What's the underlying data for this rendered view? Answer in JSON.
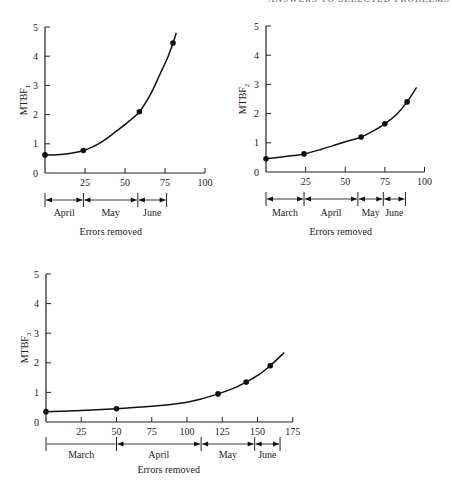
{
  "header": {
    "text": "ANSWERS TO SELECTED PROBLEMS"
  },
  "chart_data": [
    {
      "type": "line",
      "title": "",
      "xlabel": "Errors removed",
      "ylabel": "MTBF1",
      "ylabel_main": "MTBF",
      "ylabel_sub": "1",
      "xlim": [
        0,
        100
      ],
      "ylim": [
        0,
        5
      ],
      "x_ticks": [
        25,
        50,
        75,
        100
      ],
      "y_ticks": [
        0,
        1,
        2,
        3,
        4,
        5
      ],
      "grid": false,
      "points": [
        {
          "x": 0,
          "y": 0.62
        },
        {
          "x": 24,
          "y": 0.77
        },
        {
          "x": 59,
          "y": 2.1
        },
        {
          "x": 80,
          "y": 4.45
        }
      ],
      "curve": [
        [
          0,
          0.62
        ],
        [
          10,
          0.63
        ],
        [
          24,
          0.77
        ],
        [
          35,
          1.05
        ],
        [
          45,
          1.45
        ],
        [
          52,
          1.75
        ],
        [
          59,
          2.1
        ],
        [
          66,
          2.7
        ],
        [
          72,
          3.4
        ],
        [
          77,
          4.0
        ],
        [
          80,
          4.45
        ],
        [
          82,
          4.8
        ]
      ],
      "months": [
        {
          "label": "April",
          "from": 0,
          "to": 24
        },
        {
          "label": "May",
          "from": 24,
          "to": 58
        },
        {
          "label": "June",
          "from": 58,
          "to": 76
        }
      ]
    },
    {
      "type": "line",
      "title": "",
      "xlabel": "Errors removed",
      "ylabel": "MTBF2",
      "ylabel_main": "MTBF",
      "ylabel_sub": "2",
      "xlim": [
        0,
        100
      ],
      "ylim": [
        0,
        5
      ],
      "x_ticks": [
        25,
        50,
        75,
        100
      ],
      "y_ticks": [
        0,
        1,
        2,
        3,
        4,
        5
      ],
      "grid": false,
      "points": [
        {
          "x": 0,
          "y": 0.45
        },
        {
          "x": 24,
          "y": 0.62
        },
        {
          "x": 60,
          "y": 1.2
        },
        {
          "x": 75,
          "y": 1.65
        },
        {
          "x": 89,
          "y": 2.4
        }
      ],
      "curve": [
        [
          0,
          0.45
        ],
        [
          12,
          0.53
        ],
        [
          24,
          0.62
        ],
        [
          35,
          0.78
        ],
        [
          45,
          0.95
        ],
        [
          53,
          1.08
        ],
        [
          60,
          1.2
        ],
        [
          68,
          1.42
        ],
        [
          75,
          1.65
        ],
        [
          82,
          1.95
        ],
        [
          89,
          2.4
        ],
        [
          95,
          2.9
        ]
      ],
      "months": [
        {
          "label": "March",
          "from": 0,
          "to": 24
        },
        {
          "label": "April",
          "from": 24,
          "to": 58
        },
        {
          "label": "May",
          "from": 58,
          "to": 74
        },
        {
          "label": "June",
          "from": 74,
          "to": 88
        }
      ]
    },
    {
      "type": "line",
      "title": "",
      "xlabel": "Errors removed",
      "ylabel": "MTBF3",
      "ylabel_main": "MTBF",
      "ylabel_sub": "3",
      "xlim": [
        0,
        175
      ],
      "ylim": [
        0,
        5
      ],
      "x_ticks": [
        25,
        50,
        75,
        100,
        125,
        150,
        175
      ],
      "y_ticks": [
        0,
        1,
        2,
        3,
        4,
        5
      ],
      "grid": false,
      "points": [
        {
          "x": 0,
          "y": 0.35
        },
        {
          "x": 50,
          "y": 0.45
        },
        {
          "x": 122,
          "y": 0.95
        },
        {
          "x": 142,
          "y": 1.35
        },
        {
          "x": 159,
          "y": 1.9
        }
      ],
      "curve": [
        [
          0,
          0.35
        ],
        [
          25,
          0.39
        ],
        [
          50,
          0.45
        ],
        [
          75,
          0.53
        ],
        [
          95,
          0.63
        ],
        [
          110,
          0.78
        ],
        [
          122,
          0.95
        ],
        [
          132,
          1.12
        ],
        [
          142,
          1.35
        ],
        [
          151,
          1.6
        ],
        [
          159,
          1.9
        ],
        [
          169,
          2.35
        ]
      ],
      "months": [
        {
          "label": "March",
          "from": 0,
          "to": 50
        },
        {
          "label": "April",
          "from": 50,
          "to": 110
        },
        {
          "label": "May",
          "from": 110,
          "to": 148
        },
        {
          "label": "June",
          "from": 148,
          "to": 166
        }
      ]
    }
  ],
  "layout": [
    {
      "ox": 45,
      "oy": 173,
      "xscale": 1.6,
      "yscale": 29.2,
      "axis_len_x": 160,
      "month_y": 200,
      "month_label_y": 216,
      "xlabel_y": 235,
      "ylabel_x": 27
    },
    {
      "ox": 266,
      "oy": 172,
      "xscale": 1.585,
      "yscale": 29.2,
      "axis_len_x": 158.5,
      "month_y": 199,
      "month_label_y": 216,
      "xlabel_y": 235,
      "ylabel_x": 246
    },
    {
      "ox": 46,
      "oy": 422,
      "xscale": 1.41,
      "yscale": 29.6,
      "axis_len_x": 246.75,
      "month_y": 444,
      "month_label_y": 458,
      "xlabel_y": 473,
      "ylabel_x": 28
    }
  ]
}
